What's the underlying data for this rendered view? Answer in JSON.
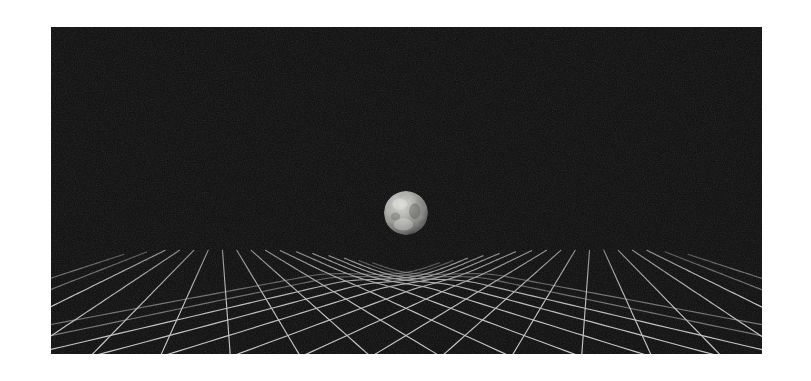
{
  "figure": {
    "caption": "",
    "canvas": {
      "width": 811,
      "height": 381,
      "background": "#ffffff"
    }
  },
  "panel": {
    "name": "spacetime-field",
    "x": 51,
    "y": 27,
    "width": 711,
    "height": 327,
    "background_color": "#0a0a0a",
    "grain": true,
    "grain_opacity": 0.55
  },
  "grid": {
    "description": "Rhombic perspective lattice representing a spacetime sheet, warped into a gravity well beneath the central body",
    "line_color": "#b9b9b9",
    "line_color_faint": "#6e6e6e",
    "line_width": 1.15,
    "family_a_label": "grid-lines-right-leaning",
    "family_b_label": "grid-lines-left-leaning",
    "lines_per_family": 17,
    "vanishing_point": {
      "x": 355,
      "y": 196
    },
    "well": {
      "center_x": 355,
      "center_y": 198,
      "radius": 150,
      "depth": 52
    }
  },
  "planet": {
    "name": "massive-body",
    "center_x": 355,
    "center_y": 186,
    "width": 44,
    "height": 54,
    "surface": "mottled grey cratered sphere",
    "highlight_color": "#f2f2ee",
    "midtone_color": "#9a9a96",
    "shadow_color": "#2a2a2a"
  },
  "chart_data": {
    "type": "scatter",
    "xlabel": "",
    "ylabel": "",
    "grid": true,
    "legend": null,
    "annotations": [
      "Rhombic grid sheet shown in perspective",
      "Central spherical mass depresses the sheet",
      "Grid lines converge and dip toward the mass"
    ]
  }
}
